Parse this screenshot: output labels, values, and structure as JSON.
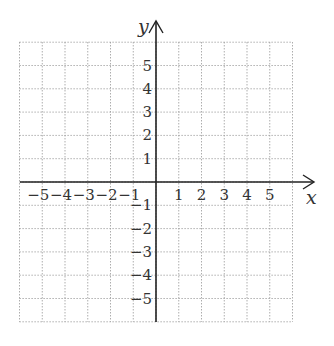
{
  "diagram": {
    "type": "coordinate-grid",
    "x_axis_label": "x",
    "y_axis_label": "y",
    "x_range": [
      -6,
      6
    ],
    "y_range": [
      -6,
      6
    ],
    "x_ticks": [
      "-5",
      "-4",
      "-3",
      "-2",
      "-1",
      "1",
      "2",
      "3",
      "4",
      "5"
    ],
    "y_ticks": [
      "5",
      "4",
      "3",
      "2",
      "1",
      "-1",
      "-2",
      "-3",
      "-4",
      "-5"
    ],
    "colors": {
      "grid": "#9a9a9a",
      "axis": "#222222",
      "text": "#333333"
    }
  }
}
